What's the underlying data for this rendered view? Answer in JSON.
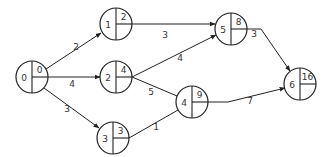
{
  "diagram": {
    "type": "activity-on-node network (critical path)",
    "nodes": [
      {
        "id": "0",
        "label": "0",
        "earliest": "0",
        "cx": 32,
        "cy": 77,
        "r": 16
      },
      {
        "id": "1",
        "label": "1",
        "earliest": "2",
        "cx": 116,
        "cy": 24,
        "r": 16
      },
      {
        "id": "2",
        "label": "2",
        "earliest": "4",
        "cx": 116,
        "cy": 77,
        "r": 16
      },
      {
        "id": "3",
        "label": "3",
        "earliest": "3",
        "cx": 113,
        "cy": 138,
        "r": 16
      },
      {
        "id": "4",
        "label": "4",
        "earliest": "9",
        "cx": 192,
        "cy": 102,
        "r": 16
      },
      {
        "id": "5",
        "label": "5",
        "earliest": "8",
        "cx": 231,
        "cy": 29,
        "r": 16
      },
      {
        "id": "6",
        "label": "6",
        "earliest": "16",
        "cx": 300,
        "cy": 84,
        "r": 16
      }
    ],
    "edges": [
      {
        "from": "0",
        "to": "1",
        "weight": "2",
        "path": "M46,69 L101,33",
        "arrow": true,
        "lx": 76,
        "ly": 50
      },
      {
        "from": "0",
        "to": "2",
        "weight": "4",
        "path": "M48,77 L100,77",
        "arrow": true,
        "lx": 72,
        "ly": 87
      },
      {
        "from": "0",
        "to": "3",
        "weight": "3",
        "path": "M44,88 L99,128",
        "arrow": true,
        "lx": 67,
        "ly": 112
      },
      {
        "from": "1",
        "to": "5",
        "weight": "3",
        "path": "M132,24 L215,24",
        "arrow": true,
        "lx": 165,
        "ly": 38
      },
      {
        "from": "2",
        "to": "5",
        "weight": "4",
        "path": "M132,77 L216,35",
        "arrow": true,
        "lx": 180,
        "ly": 61
      },
      {
        "from": "2",
        "to": "4",
        "weight": "5",
        "path": "M132,77 L177,96",
        "arrow": false,
        "lx": 151,
        "ly": 95
      },
      {
        "from": "3",
        "to": "4",
        "weight": "1",
        "path": "M129,138 L178,110",
        "arrow": false,
        "lx": 156,
        "ly": 130
      },
      {
        "from": "4",
        "to": "6",
        "weight": "7",
        "path": "M208,102 L228,102 L285,88",
        "arrow": true,
        "lx": 250,
        "ly": 104
      },
      {
        "from": "5",
        "to": "6",
        "weight": "3",
        "path": "M247,29 L261,29 L290,71",
        "arrow": true,
        "lx": 254,
        "ly": 37
      }
    ]
  }
}
